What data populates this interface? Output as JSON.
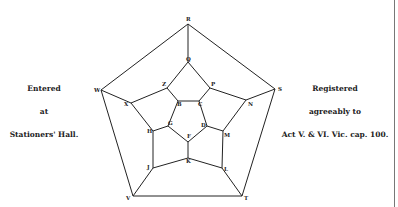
{
  "left_note": {
    "line1": "Entered",
    "line2": "at",
    "line3": "Stationers' Hall."
  },
  "right_note": {
    "line1": "Registered",
    "line2": "agreeably to",
    "line3": "Act V. & VI. Vic. cap. 100."
  },
  "graph": {
    "vertices": {
      "R": [
        188,
        24
      ],
      "S": [
        275,
        89
      ],
      "T": [
        242,
        196
      ],
      "V": [
        133,
        196
      ],
      "W": [
        101,
        90
      ],
      "Q": [
        188,
        62
      ],
      "P": [
        210,
        88
      ],
      "N": [
        246,
        100
      ],
      "M": [
        223,
        131
      ],
      "L": [
        222,
        168
      ],
      "K": [
        188,
        158
      ],
      "J": [
        153,
        168
      ],
      "H": [
        153,
        131
      ],
      "X": [
        131,
        103
      ],
      "Z": [
        167,
        88
      ],
      "B": [
        178,
        101
      ],
      "C": [
        199,
        101
      ],
      "D": [
        207,
        126
      ],
      "F": [
        188,
        142
      ],
      "G": [
        168,
        126
      ]
    },
    "edges": [
      [
        "R",
        "S"
      ],
      [
        "S",
        "T"
      ],
      [
        "T",
        "V"
      ],
      [
        "V",
        "W"
      ],
      [
        "W",
        "R"
      ],
      [
        "R",
        "Q"
      ],
      [
        "S",
        "N"
      ],
      [
        "T",
        "L"
      ],
      [
        "V",
        "J"
      ],
      [
        "W",
        "X"
      ],
      [
        "Q",
        "P"
      ],
      [
        "P",
        "N"
      ],
      [
        "N",
        "M"
      ],
      [
        "M",
        "L"
      ],
      [
        "L",
        "K"
      ],
      [
        "K",
        "J"
      ],
      [
        "J",
        "H"
      ],
      [
        "H",
        "X"
      ],
      [
        "X",
        "Z"
      ],
      [
        "Z",
        "Q"
      ],
      [
        "P",
        "C"
      ],
      [
        "M",
        "D"
      ],
      [
        "K",
        "F"
      ],
      [
        "H",
        "G"
      ],
      [
        "Z",
        "B"
      ],
      [
        "B",
        "C"
      ],
      [
        "C",
        "D"
      ],
      [
        "D",
        "F"
      ],
      [
        "F",
        "G"
      ],
      [
        "G",
        "B"
      ]
    ],
    "labels": {
      "R": "R",
      "S": "S",
      "T": "T",
      "V": "V",
      "W": "W",
      "Q": "Q",
      "P": "P",
      "N": "N",
      "M": "M",
      "L": "L",
      "K": "K",
      "J": "J",
      "H": "H",
      "X": "X",
      "Z": "Z",
      "B": "B",
      "C": "C",
      "D": "D",
      "F": "F",
      "G": "G"
    }
  }
}
